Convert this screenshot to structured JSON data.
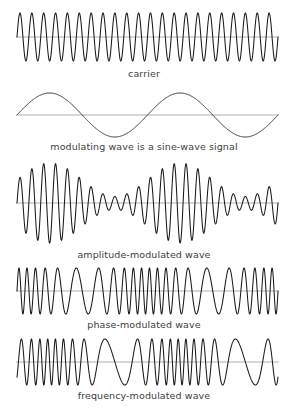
{
  "figure": {
    "background_color": "#ffffff",
    "trace_color": "#1a1a1a",
    "axis_color": "#8c8c8c",
    "caption_color": "#3d3d3d",
    "width": 288,
    "height": 414,
    "plot_left": 17,
    "plot_right": 278
  },
  "panels": [
    {
      "id": "carrier",
      "caption": "carrier",
      "top": 8,
      "plot_height": 58,
      "caption_top": 68,
      "wave": {
        "kind": "carrier",
        "cycles": 22,
        "amplitude": 24,
        "baseline": 29,
        "phase": 0
      }
    },
    {
      "id": "modulating",
      "caption": "modulating wave is a sine-wave signal",
      "top": 86,
      "plot_height": 56,
      "caption_top": 141,
      "wave": {
        "kind": "modulating",
        "cycles": 2,
        "amplitude": 22,
        "baseline": 29,
        "phase": 0
      }
    },
    {
      "id": "amplitude-modulated",
      "caption": "amplitude-modulated wave",
      "top": 160,
      "plot_height": 86,
      "caption_top": 249,
      "wave": {
        "kind": "am",
        "cycles": 22,
        "amplitude": 40,
        "baseline": 43,
        "mod_cycles": 2,
        "mod_index": 0.72,
        "phase": 0
      }
    },
    {
      "id": "phase-modulated",
      "caption": "phase-modulated wave",
      "top": 265,
      "plot_height": 52,
      "caption_top": 319,
      "wave": {
        "kind": "pm",
        "cycles": 22,
        "amplitude": 23,
        "baseline": 26,
        "mod_cycles": 2,
        "deviation": 5.6,
        "phase": 0
      }
    },
    {
      "id": "frequency-modulated",
      "caption": "frequency-modulated wave",
      "top": 336,
      "plot_height": 52,
      "caption_top": 390,
      "wave": {
        "kind": "fm",
        "cycles": 20,
        "amplitude": 23,
        "baseline": 26,
        "mod_cycles": 2,
        "deviation": 7.0,
        "phase": 0
      }
    }
  ],
  "chart_data": {
    "type": "line",
    "xlabel": "",
    "ylabel": "",
    "grid": false,
    "legend": "none",
    "x_range": [
      0,
      1
    ],
    "series": [
      {
        "name": "carrier",
        "description": "Unmodulated constant-amplitude constant-frequency sinusoid",
        "carrier_cycles": 22,
        "amplitude": 1.0,
        "equation": "A*sin(2*pi*fc*t)"
      },
      {
        "name": "modulating wave is a sine-wave signal",
        "description": "Low-frequency sine-wave message signal",
        "carrier_cycles": 2,
        "amplitude": 1.0,
        "equation": "Am*sin(2*pi*fm*t)"
      },
      {
        "name": "amplitude-modulated wave",
        "description": "Carrier amplitude varies with the modulating sine; envelope shows two cycles",
        "carrier_cycles": 22,
        "modulating_cycles": 2,
        "modulation_index": 0.72,
        "equation": "A*(1+m*sin(2*pi*fm*t))*sin(2*pi*fc*t)"
      },
      {
        "name": "phase-modulated wave",
        "description": "Carrier phase varies with the modulating sine; compression at start, middle and end",
        "carrier_cycles": 22,
        "modulating_cycles": 2,
        "phase_deviation": 5.6,
        "equation": "A*sin(2*pi*fc*t + beta*sin(2*pi*fm*t))"
      },
      {
        "name": "frequency-modulated wave",
        "description": "Carrier frequency varies with the modulating sine; compression near one-third and five-sixths",
        "carrier_cycles": 20,
        "modulating_cycles": 2,
        "frequency_deviation": 7.0,
        "equation": "A*sin(2*pi*fc*t - beta*cos(2*pi*fm*t))"
      }
    ]
  }
}
